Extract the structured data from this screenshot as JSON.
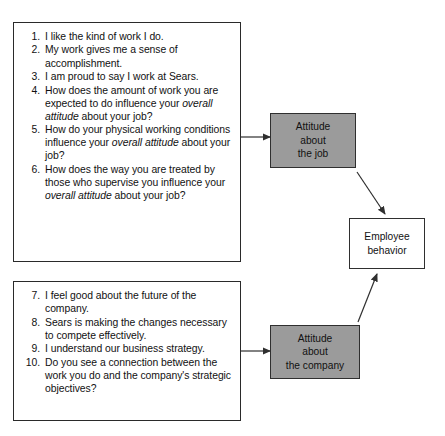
{
  "question_panels": [
    {
      "id": "job-attitude-questions",
      "items": [
        {
          "num": "1.",
          "segments": [
            {
              "t": "I like the kind of work I do.",
              "i": false
            }
          ]
        },
        {
          "num": "2.",
          "segments": [
            {
              "t": "My work gives me a sense of accomplishment.",
              "i": false
            }
          ]
        },
        {
          "num": "3.",
          "segments": [
            {
              "t": "I am proud to say I work at Sears.",
              "i": false
            }
          ]
        },
        {
          "num": "4.",
          "segments": [
            {
              "t": "How does the amount of work you are expected to do influence your ",
              "i": false
            },
            {
              "t": "overall attitude",
              "i": true
            },
            {
              "t": " about your job?",
              "i": false
            }
          ]
        },
        {
          "num": "5.",
          "segments": [
            {
              "t": "How do your physical working conditions influence your ",
              "i": false
            },
            {
              "t": "overall attitude",
              "i": true
            },
            {
              "t": " about your job?",
              "i": false
            }
          ]
        },
        {
          "num": "6.",
          "segments": [
            {
              "t": "How does the way you are treated by those who supervise you influence your ",
              "i": false
            },
            {
              "t": "overall attitude",
              "i": true
            },
            {
              "t": " about your job?",
              "i": false
            }
          ]
        }
      ]
    },
    {
      "id": "company-attitude-questions",
      "items": [
        {
          "num": "7.",
          "segments": [
            {
              "t": "I feel good about the future of the company.",
              "i": false
            }
          ]
        },
        {
          "num": "8.",
          "segments": [
            {
              "t": "Sears is making the changes necessary to compete effectively.",
              "i": false
            }
          ]
        },
        {
          "num": "9.",
          "segments": [
            {
              "t": "I understand our business strategy.",
              "i": false
            }
          ]
        },
        {
          "num": "10.",
          "segments": [
            {
              "t": "Do you see a connection between the work you do and the company's strategic objectives?",
              "i": false
            }
          ]
        }
      ]
    }
  ],
  "diagram": {
    "nodes": [
      {
        "id": "attitude-job",
        "lines": [
          "Attitude",
          "about",
          "the job"
        ],
        "fill": "#9b9b9b",
        "border": "#2f2f2f"
      },
      {
        "id": "employee-behavior",
        "lines": [
          "Employee",
          "behavior"
        ],
        "fill": "#ffffff",
        "border": "#2f2f2f"
      },
      {
        "id": "attitude-company",
        "lines": [
          "Attitude",
          "about",
          "the company"
        ],
        "fill": "#9b9b9b",
        "border": "#2f2f2f"
      }
    ],
    "connectors": [
      {
        "id": "questions-to-attitude-job",
        "from": "job-attitude-questions",
        "to": "attitude-job",
        "kind": "horizontal-arrow"
      },
      {
        "id": "questions-to-attitude-company",
        "from": "company-attitude-questions",
        "to": "attitude-company",
        "kind": "horizontal-arrow"
      },
      {
        "id": "attitude-job-to-behavior",
        "from": "attitude-job",
        "to": "employee-behavior",
        "kind": "diagonal-arrow"
      },
      {
        "id": "attitude-company-to-behavior",
        "from": "attitude-company",
        "to": "employee-behavior",
        "kind": "diagonal-arrow"
      }
    ],
    "line_color": "#2f2f2f"
  }
}
